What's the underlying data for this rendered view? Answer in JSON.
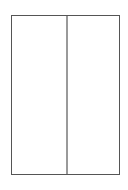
{
  "diagram": {
    "type": "two-column-panel",
    "frame": {
      "border_color": "#555555",
      "background": "#ffffff"
    },
    "divider": {
      "orientation": "vertical",
      "color": "#9a9a9a"
    },
    "panes": [
      {
        "id": "left",
        "label": ""
      },
      {
        "id": "right",
        "label": ""
      }
    ]
  }
}
